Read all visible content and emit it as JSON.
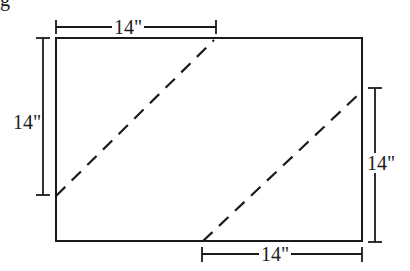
{
  "figure": {
    "caption_fragment": "g",
    "colors": {
      "stroke": "#1a1a1a",
      "background": "#ffffff"
    },
    "rectangle": {
      "x": 56,
      "y": 38,
      "width": 306,
      "height": 203
    },
    "dimensions": {
      "top": {
        "label": "14\"",
        "x1": 56,
        "x2": 216,
        "y": 27
      },
      "left": {
        "label": "14\"",
        "x": 43,
        "y1": 38,
        "y2": 195
      },
      "right": {
        "label": "14\"",
        "x": 375,
        "y1": 88,
        "y2": 242
      },
      "bottom": {
        "label": "14\"",
        "x1": 202,
        "x2": 362,
        "y": 254
      }
    },
    "cut_lines": [
      {
        "name": "upper-diagonal",
        "x1": 56,
        "y1": 196,
        "x2": 214,
        "y2": 40,
        "style": "dashed"
      },
      {
        "name": "lower-diagonal",
        "x1": 203,
        "y1": 241,
        "x2": 360,
        "y2": 93,
        "style": "dashed"
      }
    ]
  }
}
